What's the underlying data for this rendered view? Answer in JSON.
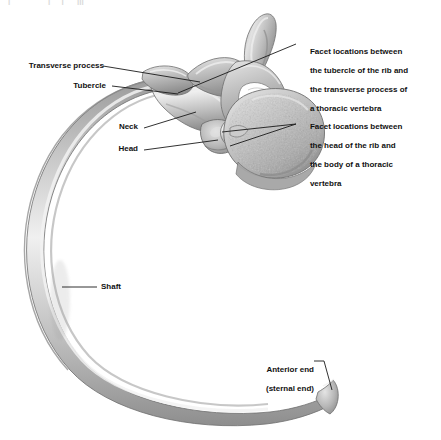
{
  "figure": {
    "background_color": "#ffffff",
    "text_color": "#111111",
    "leader_color": "#1a1a1a",
    "bone_colors": {
      "light": "#efefef",
      "mid": "#c9c9c9",
      "shade": "#a8a8a8",
      "dark": "#8a8a8a",
      "outline": "#7a7a7a",
      "body_fill": "#bdbdbd",
      "foramen": "#ffffff"
    }
  },
  "top_artifact": {
    "text": "|                 |     |      |||"
  },
  "labels": {
    "transverse_process": {
      "text": "Transverse process",
      "x": 14,
      "y": 61
    },
    "tubercle": {
      "text": "Tubercle",
      "x": 80,
      "y": 81
    },
    "neck": {
      "text": "Neck",
      "x": 120,
      "y": 125
    },
    "head": {
      "text": "Head",
      "x": 118,
      "y": 147
    },
    "shaft": {
      "text": "Shaft",
      "x": 100,
      "y": 284
    },
    "anterior_end": {
      "line1": "Anterior end",
      "line2": "(sternal end)",
      "x": 256,
      "y": 358
    },
    "facet_tubercle": {
      "line1": "Facet locations between",
      "line2": "the tubercle of the rib and",
      "line3": "the transverse process of",
      "line4": "a thoracic vertebra",
      "x": 300,
      "y": 38
    },
    "facet_head": {
      "line1": "Facet locations between",
      "line2": "the head of the rib and",
      "line3": "the body of a thoracic",
      "line4": "vertebra",
      "x": 300,
      "y": 113
    }
  },
  "structures": {
    "rib": "rib-bone",
    "vertebra": "thoracic-vertebra-bone",
    "spinous_process": "spinous-process",
    "vertebral_body": "vertebral-body",
    "vertebral_foramen": "vertebral-foramen",
    "rib_head": "rib-head",
    "rib_neck": "rib-neck",
    "rib_tubercle": "rib-tubercle",
    "rib_shaft": "rib-shaft",
    "sternal_end": "sternal-end"
  }
}
